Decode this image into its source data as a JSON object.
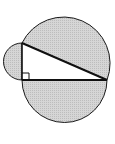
{
  "diagram": {
    "type": "geometry",
    "colors": {
      "background": "#ffffff",
      "shading": "#cfcfcf",
      "stroke": "#1a1a1a",
      "triangle_fill": "#ffffff"
    },
    "triangle": {
      "vertices": {
        "top": [
          22,
          43
        ],
        "right_angle": [
          22,
          80
        ],
        "right": [
          107,
          80
        ]
      },
      "right_angle_marker": true
    },
    "semicircles": [
      {
        "name": "left-leg-semicircle",
        "on_side": "vertical leg",
        "bulge": "left"
      },
      {
        "name": "hypotenuse-semicircle",
        "on_side": "hypotenuse",
        "bulge": "up-right"
      },
      {
        "name": "bottom-leg-semicircle",
        "on_side": "horizontal leg",
        "bulge": "down"
      }
    ]
  }
}
